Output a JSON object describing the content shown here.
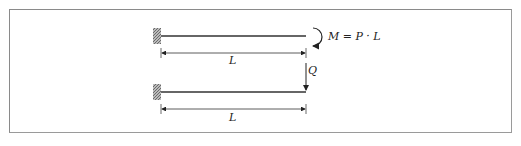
{
  "diagram": {
    "beam_top": {
      "moment_label": "M = P · L",
      "length_label": "L"
    },
    "beam_bottom": {
      "force_label": "Q",
      "length_label": "L"
    },
    "colors": {
      "line": "#333333",
      "frame": "#8a8a8a",
      "hatch": "#777777"
    }
  }
}
